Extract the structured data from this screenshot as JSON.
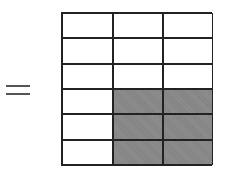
{
  "equation": {
    "symbol": "="
  },
  "grid": {
    "rows": 6,
    "columns": 3,
    "shaded_color": "#8e8e8e",
    "cells": [
      [
        false,
        false,
        false
      ],
      [
        false,
        false,
        false
      ],
      [
        false,
        false,
        false
      ],
      [
        false,
        true,
        true
      ],
      [
        false,
        true,
        true
      ],
      [
        false,
        true,
        true
      ]
    ],
    "shaded_count": 6,
    "total_count": 18
  }
}
